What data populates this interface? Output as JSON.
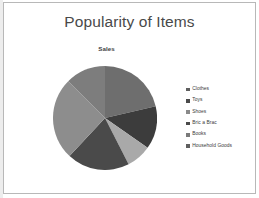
{
  "slide": {
    "title": "Popularity of Items",
    "background_color": "#ffffff",
    "frame_color": "#b8b8b8",
    "title_color": "#494949"
  },
  "chart_data": {
    "type": "pie",
    "title": "Sales",
    "xlabel": "",
    "ylabel": "",
    "legend_position": "right",
    "grid": false,
    "categories": [
      "Clothes",
      "Toys",
      "Shoes",
      "Bric a Brac",
      "Books",
      "Household Goods"
    ],
    "values": [
      21,
      13,
      8,
      19,
      26,
      13
    ],
    "slice_angles_deg": [
      77,
      48,
      28,
      70,
      92,
      45
    ],
    "colors": [
      "#6e6e6e",
      "#3c3c3c",
      "#a9a9a9",
      "#4a4a4a",
      "#8d8d8d",
      "#7d7d7d"
    ],
    "slices": [
      {
        "label": "Clothes",
        "value": 21,
        "angle_deg": 77,
        "color": "#6e6e6e"
      },
      {
        "label": "Toys",
        "value": 13,
        "angle_deg": 48,
        "color": "#3c3c3c"
      },
      {
        "label": "Shoes",
        "value": 8,
        "angle_deg": 28,
        "color": "#a9a9a9"
      },
      {
        "label": "Bric a Brac",
        "value": 19,
        "angle_deg": 70,
        "color": "#4a4a4a"
      },
      {
        "label": "Books",
        "value": 26,
        "angle_deg": 92,
        "color": "#8d8d8d"
      },
      {
        "label": "Household Goods",
        "value": 13,
        "angle_deg": 45,
        "color": "#7d7d7d"
      }
    ]
  },
  "legend": {
    "items": [
      {
        "label": "Clothes",
        "color": "#5f5f5f"
      },
      {
        "label": "Toys",
        "color": "#4a4a4a"
      },
      {
        "label": "Shoes",
        "color": "#8a8a8a"
      },
      {
        "label": "Bric a Brac",
        "color": "#4a4a4a"
      },
      {
        "label": "Books",
        "color": "#7a7a7a"
      },
      {
        "label": "Household Goods",
        "color": "#5f5f5f"
      }
    ]
  }
}
